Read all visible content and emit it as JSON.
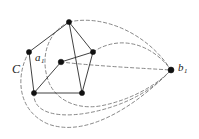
{
  "figure": {
    "type": "graph-diagram",
    "width": 199,
    "height": 139,
    "background_color": "#ffffff",
    "solid_edge_color": "#2b2b2b",
    "dashed_edge_color": "#7a7a7a",
    "vertex_color": "#111111"
  },
  "labels": {
    "cycle": {
      "base": "C",
      "sub": ""
    },
    "vertex_a1": {
      "base": "a",
      "sub": "1"
    },
    "vertex_b1": {
      "base": "b",
      "sub": "1"
    }
  },
  "graph": {
    "vertices": [
      {
        "id": "v_top",
        "x": 69,
        "y": 22,
        "r": 2.6
      },
      {
        "id": "v_left",
        "x": 29,
        "y": 52,
        "r": 2.6
      },
      {
        "id": "v_right",
        "x": 93,
        "y": 52,
        "r": 2.6
      },
      {
        "id": "v_center",
        "x": 61,
        "y": 62,
        "r": 2.8
      },
      {
        "id": "v_bottom_left",
        "x": 34,
        "y": 93,
        "r": 2.6
      },
      {
        "id": "v_bottom_right",
        "x": 82,
        "y": 93,
        "r": 2.6
      },
      {
        "id": "v_b1",
        "x": 171,
        "y": 70,
        "r": 3.0
      }
    ],
    "solid_edges": [
      {
        "from": "v_top",
        "to": "v_left"
      },
      {
        "from": "v_top",
        "to": "v_right"
      },
      {
        "from": "v_top",
        "to": "v_bottom_right"
      },
      {
        "from": "v_left",
        "to": "v_bottom_left"
      },
      {
        "from": "v_right",
        "to": "v_center"
      },
      {
        "from": "v_right",
        "to": "v_bottom_right"
      },
      {
        "from": "v_bottom_left",
        "to": "v_bottom_right"
      },
      {
        "from": "v_center",
        "to": "v_bottom_left"
      }
    ],
    "dashed_edges": [
      {
        "from": "v_top",
        "to": "v_b1",
        "label": "arc-top-outer"
      },
      {
        "from": "v_right",
        "to": "v_b1",
        "label": "arc-right-upper"
      },
      {
        "from": "v_center",
        "to": "v_b1",
        "label": "arc-center"
      },
      {
        "from": "v_bottom_left",
        "to": "v_b1",
        "label": "arc-lower"
      },
      {
        "from": "v_left",
        "to": "v_b1",
        "label": "arc-outer-bottom"
      }
    ]
  }
}
